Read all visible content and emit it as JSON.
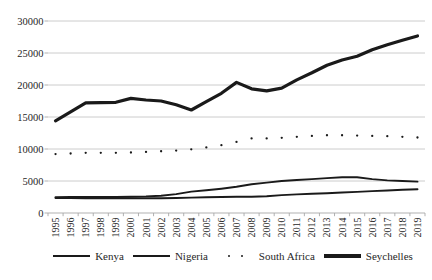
{
  "chart_data": {
    "type": "line",
    "title": "",
    "xlabel": "",
    "ylabel": "",
    "x": [
      1995,
      1996,
      1997,
      1998,
      1999,
      2000,
      2001,
      2002,
      2003,
      2004,
      2005,
      2006,
      2007,
      2008,
      2009,
      2010,
      2011,
      2012,
      2013,
      2014,
      2015,
      2016,
      2017,
      2018,
      2019
    ],
    "series": [
      {
        "name": "Kenya",
        "style": "solid-medium",
        "values": [
          2350,
          2350,
          2320,
          2300,
          2300,
          2300,
          2300,
          2310,
          2350,
          2400,
          2450,
          2500,
          2550,
          2550,
          2620,
          2800,
          2900,
          3000,
          3100,
          3200,
          3300,
          3420,
          3520,
          3620,
          3700
        ]
      },
      {
        "name": "Nigeria",
        "style": "solid-medium",
        "values": [
          2450,
          2500,
          2500,
          2500,
          2500,
          2550,
          2600,
          2700,
          2950,
          3350,
          3550,
          3800,
          4100,
          4500,
          4750,
          5000,
          5150,
          5300,
          5450,
          5600,
          5600,
          5300,
          5100,
          5000,
          4900
        ]
      },
      {
        "name": "South Africa",
        "style": "dotted",
        "values": [
          9200,
          9300,
          9400,
          9400,
          9400,
          9450,
          9550,
          9650,
          9750,
          9950,
          10250,
          10600,
          11100,
          11650,
          11650,
          11750,
          11900,
          12050,
          12150,
          12150,
          12100,
          12050,
          12000,
          11900,
          11800
        ]
      },
      {
        "name": "Seychelles",
        "style": "solid-thick",
        "values": [
          14400,
          15800,
          17200,
          17250,
          17300,
          17900,
          17650,
          17500,
          16900,
          16100,
          17400,
          18700,
          20400,
          19400,
          19100,
          19500,
          20800,
          21900,
          23100,
          23900,
          24500,
          25500,
          26300,
          27000,
          27650
        ]
      }
    ],
    "ylim": [
      0,
      30000
    ],
    "yticks": [
      0,
      5000,
      10000,
      15000,
      20000,
      25000,
      30000
    ],
    "grid": "horizontal",
    "legend_position": "bottom",
    "colors": {
      "line": "#1a1a1a",
      "grid": "#c6c6c6",
      "axis": "#a8a8a8",
      "text": "#262626",
      "background": "#ffffff"
    }
  }
}
